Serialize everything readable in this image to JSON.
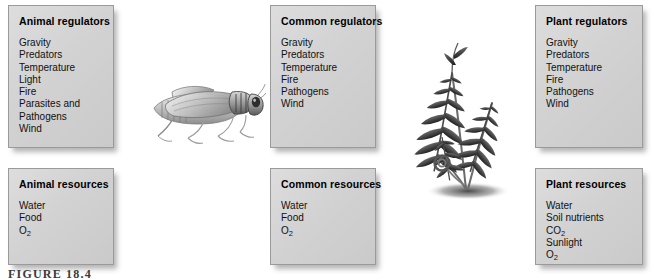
{
  "figure": {
    "caption": "FIGURE 18.4",
    "background_color": "#ffffff",
    "box_fill_color": "#d4d4d4",
    "box_border_color": "#9a9a9a"
  },
  "boxes": [
    {
      "id": "animal-regulators",
      "title": "Animal regulators",
      "items": [
        "Gravity",
        "Predators",
        "Temperature",
        "Light",
        "Fire",
        "Parasites and",
        "Pathogens",
        "Wind"
      ]
    },
    {
      "id": "common-regulators",
      "title": "Common regulators",
      "items": [
        "Gravity",
        "Predators",
        "Temperature",
        "Fire",
        "Pathogens",
        "Wind"
      ]
    },
    {
      "id": "plant-regulators",
      "title": "Plant regulators",
      "items": [
        "Gravity",
        "Predators",
        "Temperature",
        "Fire",
        "Pathogens",
        "Wind"
      ]
    },
    {
      "id": "animal-resources",
      "title": "Animal resources",
      "items": [
        "Water",
        "Food",
        "O2"
      ]
    },
    {
      "id": "common-resources",
      "title": "Common resources",
      "items": [
        "Water",
        "Food",
        "O2"
      ]
    },
    {
      "id": "plant-resources",
      "title": "Plant resources",
      "items": [
        "Water",
        "Soil nutrients",
        "CO2",
        "Sunlight",
        "O2"
      ]
    }
  ],
  "illustrations": [
    {
      "id": "grasshopper",
      "name": "grasshopper-illustration",
      "description": "Grayscale grasshopper facing right"
    },
    {
      "id": "fern",
      "name": "fern-illustration",
      "description": "Dark fern with fiddlehead and ground shadow"
    }
  ]
}
